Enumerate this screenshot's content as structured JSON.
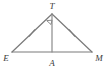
{
  "figure": {
    "kind": "geometry-diagram",
    "shape": "isosceles-triangle",
    "background_color": "#ffffff",
    "stroke_color": "#7a7a7a",
    "label_color": "#3a3a3a",
    "vertices": [
      {
        "id": "T",
        "label": "T",
        "x": 52,
        "y": 14,
        "label_x": 52,
        "label_y": 8
      },
      {
        "id": "E",
        "label": "E",
        "x": 12,
        "y": 52,
        "label_x": 6,
        "label_y": 58
      },
      {
        "id": "M",
        "label": "M",
        "x": 92,
        "y": 52,
        "label_x": 98,
        "label_y": 58
      },
      {
        "id": "A",
        "label": "A",
        "x": 52,
        "y": 52,
        "label_x": 52,
        "label_y": 64
      }
    ],
    "segments": [
      {
        "id": "ET",
        "from": "E",
        "to": "T",
        "style": "solid"
      },
      {
        "id": "TM",
        "from": "T",
        "to": "M",
        "style": "solid"
      },
      {
        "id": "EM",
        "from": "E",
        "to": "M",
        "style": "solid"
      },
      {
        "id": "TA",
        "from": "T",
        "to": "A",
        "style": "solid",
        "role": "altitude"
      }
    ],
    "tick_marks": [
      {
        "on_segment": "ET",
        "count": 1,
        "x": 32,
        "y": 33
      },
      {
        "on_segment": "TM",
        "count": 1,
        "x": 72,
        "y": 33
      }
    ],
    "angle_markers": [
      {
        "at_vertex": "T",
        "type": "right-angle-square",
        "size": 7
      }
    ]
  }
}
